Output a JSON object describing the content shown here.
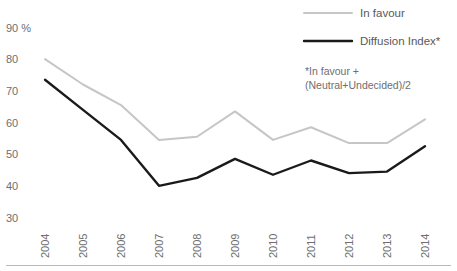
{
  "chart_data": {
    "type": "line",
    "title": "",
    "xlabel": "",
    "ylabel": "",
    "categories": [
      "2004",
      "2005",
      "2006",
      "2007",
      "2008",
      "2009",
      "2010",
      "2011",
      "2012",
      "2013",
      "2014"
    ],
    "ylim": [
      30,
      90
    ],
    "yticks": [
      "90 %",
      "80",
      "70",
      "60",
      "50",
      "40",
      "30"
    ],
    "ytick_values": [
      90,
      80,
      70,
      60,
      50,
      40,
      30
    ],
    "ytick_unit": "%",
    "grid": false,
    "legend_position": "top-right",
    "series": [
      {
        "name": "In favour",
        "color": "#c6c6c6",
        "width": 2,
        "values": [
          80,
          72,
          65.5,
          54.5,
          55.5,
          63.5,
          54.5,
          58.5,
          53.5,
          53.5,
          61
        ]
      },
      {
        "name": "Diffusion Index*",
        "color": "#1a1a1a",
        "width": 2.4,
        "values": [
          73.5,
          64,
          54.5,
          40,
          42.5,
          48.5,
          43.5,
          48,
          44,
          44.5,
          52.5
        ]
      }
    ],
    "annotations": [
      "*In favour +",
      "(Neutral+Undecided)/2"
    ]
  },
  "legend": {
    "items": [
      {
        "label": "In favour"
      },
      {
        "label": "Diffusion Index*"
      }
    ]
  },
  "footnote": {
    "line1": "*In favour +",
    "line2": "(Neutral+Undecided)/2"
  }
}
